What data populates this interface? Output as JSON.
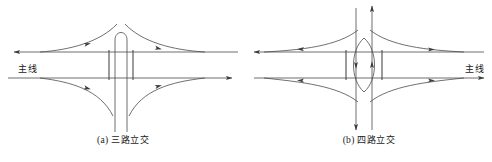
{
  "figures": [
    {
      "id": "three-way",
      "caption_index": "(a)",
      "caption_text": "三路立交",
      "mainline_label": "主线",
      "mainline_label_side": "left"
    },
    {
      "id": "four-way",
      "caption_index": "(b)",
      "caption_text": "四路立交",
      "mainline_label": "主线",
      "mainline_label_side": "right"
    }
  ],
  "colors": {
    "line": "#4a4a4a",
    "text": "#1a1a1a",
    "background": "#ffffff"
  }
}
